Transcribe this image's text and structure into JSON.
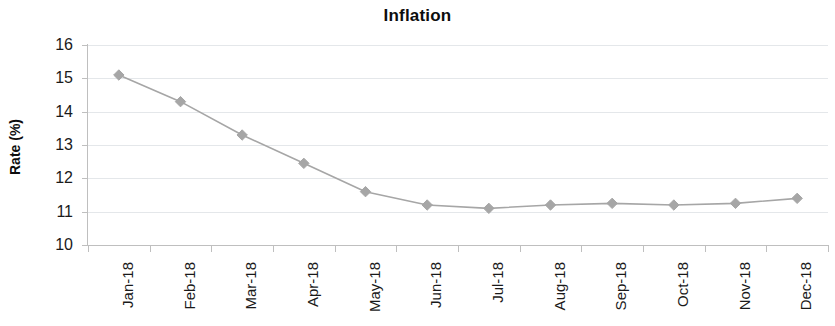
{
  "chart_data": {
    "type": "line",
    "title": "Inflation",
    "xlabel": "",
    "ylabel": "Rate (%)",
    "categories": [
      "Jan-18",
      "Feb-18",
      "Mar-18",
      "Apr-18",
      "May-18",
      "Jun-18",
      "Jul-18",
      "Aug-18",
      "Sep-18",
      "Oct-18",
      "Nov-18",
      "Dec-18"
    ],
    "values": [
      15.1,
      14.3,
      13.3,
      12.45,
      11.6,
      11.2,
      11.1,
      11.2,
      11.25,
      11.2,
      11.25,
      11.4
    ],
    "series": [
      {
        "name": "Inflation",
        "values": [
          15.1,
          14.3,
          13.3,
          12.45,
          11.6,
          11.2,
          11.1,
          11.2,
          11.25,
          11.2,
          11.25,
          11.4
        ]
      }
    ],
    "ylim": [
      10,
      16
    ],
    "ytick_labels": [
      "16",
      "15",
      "14",
      "13",
      "12",
      "11",
      "10"
    ],
    "ytick_values": [
      16,
      15,
      14,
      13,
      12,
      11,
      10
    ],
    "ytick_step": 1,
    "grid": true,
    "grid_axis": "y",
    "legend": false,
    "legend_position": "none",
    "marker": "diamond",
    "line_color": "#a6a6a6",
    "marker_color": "#a6a6a6",
    "grid_color": "#e4e7ea",
    "axis_color": "#bfbfbf",
    "text_color": "#1a1a1a"
  }
}
